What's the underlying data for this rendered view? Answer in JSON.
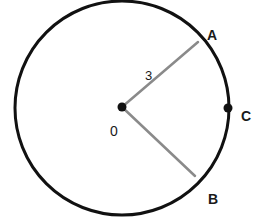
{
  "figure": {
    "type": "circle-sector-diagram",
    "width": 259,
    "height": 220,
    "background_color": "#FFFFFF",
    "circle": {
      "name": "main-circle",
      "center_x": 122,
      "center_y": 108,
      "radius": 107,
      "stroke_color": "#111111",
      "stroke_width": 3,
      "fill": "none"
    },
    "points": [
      {
        "id": "center",
        "label": "0",
        "x": 122,
        "y": 107,
        "dot": true,
        "dot_radius": 4.5,
        "dot_color": "#111111",
        "label_x": 110,
        "label_y": 124,
        "bold": false
      },
      {
        "id": "A",
        "label": "A",
        "x": 198,
        "y": 42,
        "dot": false,
        "label_x": 207,
        "label_y": 28,
        "bold": true
      },
      {
        "id": "B",
        "label": "B",
        "x": 195,
        "y": 176,
        "dot": false,
        "label_x": 208,
        "label_y": 192,
        "bold": true
      },
      {
        "id": "C",
        "label": "C",
        "x": 228,
        "y": 108,
        "dot": true,
        "dot_radius": 4.5,
        "dot_color": "#111111",
        "label_x": 241,
        "label_y": 109,
        "bold": true
      }
    ],
    "radii": [
      {
        "id": "radius-OA",
        "from": "center",
        "to": "A",
        "x1": 122,
        "y1": 107,
        "x2": 198,
        "y2": 42,
        "stroke_color": "#8A8A8A",
        "stroke_width": 2.5
      },
      {
        "id": "radius-OB",
        "from": "center",
        "to": "B",
        "x1": 122,
        "y1": 107,
        "x2": 195,
        "y2": 176,
        "stroke_color": "#8A8A8A",
        "stroke_width": 2.5
      }
    ],
    "measurements": [
      {
        "id": "radius-length",
        "value": "3",
        "applies_to": "radius-OA",
        "label_x": 145,
        "label_y": 69
      }
    ]
  }
}
